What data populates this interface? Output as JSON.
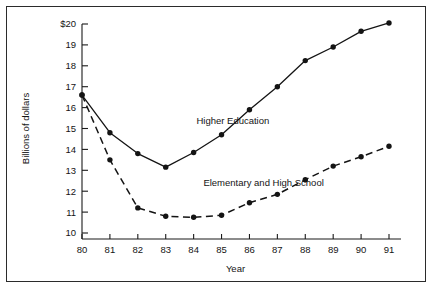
{
  "chart_data": {
    "type": "line",
    "title": "",
    "xlabel": "Year",
    "ylabel": "Billions of dollars",
    "categories": [
      "80",
      "81",
      "82",
      "83",
      "84",
      "85",
      "86",
      "87",
      "88",
      "89",
      "90",
      "91"
    ],
    "x": [
      80,
      81,
      82,
      83,
      84,
      85,
      86,
      87,
      88,
      89,
      90,
      91
    ],
    "xlim": [
      80,
      91
    ],
    "ylim": [
      10,
      20
    ],
    "grid": false,
    "legend_position": "inline-annotation",
    "y_tick_labels": [
      "$20",
      "19",
      "18",
      "17",
      "16",
      "15",
      "14",
      "13",
      "12",
      "11",
      "10"
    ],
    "y_tick_values": [
      20,
      19,
      18,
      17,
      16,
      15,
      14,
      13,
      12,
      11,
      10
    ],
    "x_tick_labels": [
      "80",
      "81",
      "82",
      "83",
      "84",
      "85",
      "86",
      "87",
      "88",
      "89",
      "90",
      "91"
    ],
    "series": [
      {
        "name": "Higher Education",
        "style": "solid",
        "marker": "filled-circle",
        "color": "#141414",
        "values": [
          16.6,
          14.8,
          13.8,
          13.15,
          13.85,
          14.7,
          15.9,
          17.0,
          18.25,
          18.9,
          19.65,
          20.05
        ],
        "label_x": 84.1,
        "label_y": 15.2
      },
      {
        "name": "Elementary and High School",
        "style": "dashed",
        "marker": "filled-circle",
        "color": "#141414",
        "values": [
          16.6,
          13.5,
          11.2,
          10.8,
          10.75,
          10.85,
          11.45,
          11.85,
          12.55,
          13.2,
          13.65,
          14.15
        ],
        "label_x": 84.35,
        "label_y": 12.25
      }
    ],
    "annotations": [
      {
        "text": "Higher Education",
        "x": 84.1,
        "y": 15.2
      },
      {
        "text": "Elementary and High School",
        "x": 84.35,
        "y": 12.25
      }
    ]
  }
}
